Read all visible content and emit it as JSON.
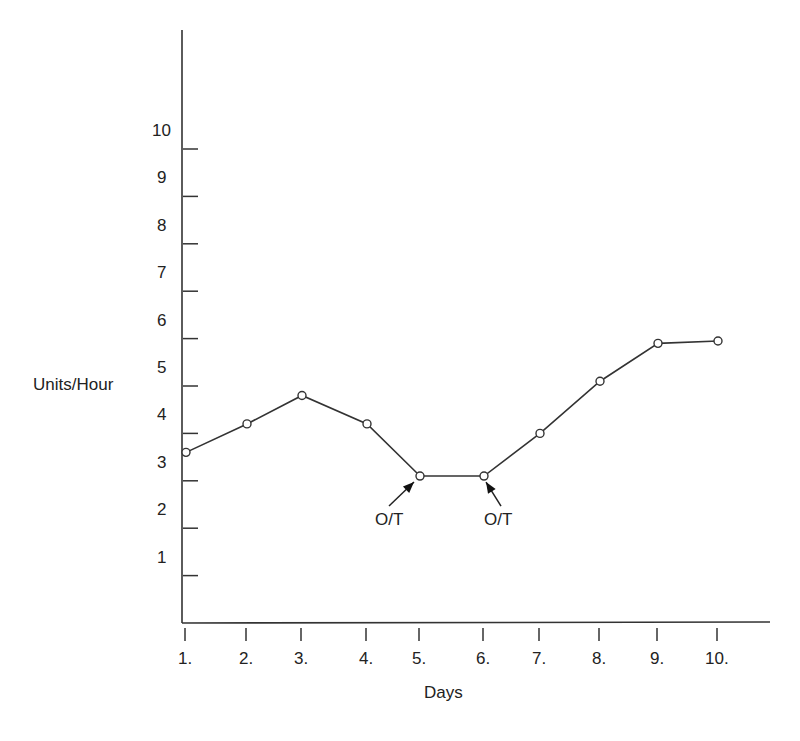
{
  "chart_data": {
    "type": "line",
    "title": "",
    "xlabel": "Days",
    "ylabel": "Units/Hour",
    "categories": [
      "1.",
      "2.",
      "3.",
      "4.",
      "5.",
      "6.",
      "7.",
      "8.",
      "9.",
      "10."
    ],
    "series": [
      {
        "name": "Units/Hour",
        "values": [
          3.6,
          4.2,
          4.8,
          4.2,
          3.1,
          3.1,
          4.0,
          5.1,
          5.9,
          5.95
        ],
        "marker": "open-circle"
      }
    ],
    "yticks": [
      1,
      2,
      3,
      4,
      5,
      6,
      7,
      8,
      9,
      10
    ],
    "ylim": [
      0,
      12.6
    ],
    "grid": false,
    "legend": null,
    "annotations": [
      {
        "text": "O/T",
        "point_index": 4,
        "arrow": "from lower-left"
      },
      {
        "text": "O/T",
        "point_index": 5,
        "arrow": "from lower-right"
      }
    ],
    "line_color": "#333333"
  }
}
